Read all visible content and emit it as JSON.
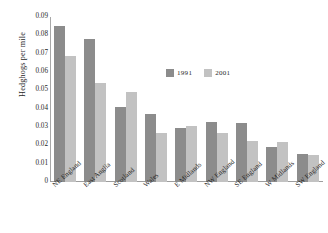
{
  "chart_data": {
    "type": "bar",
    "title": "",
    "xlabel": "",
    "ylabel": "Hedghogs per mile",
    "ylim": [
      0,
      0.09
    ],
    "grid": false,
    "legend_position": "center-right",
    "categories": [
      "NE England",
      "East Anglia",
      "Scotland",
      "Wales",
      "E Midlands",
      "NW England",
      "SE England",
      "W Midlands",
      "SW England"
    ],
    "ytick_labels": [
      "0.09",
      "0.08",
      "0.07",
      "0.06",
      "0.05",
      "0.04",
      "0.03",
      "0.02",
      "0.01",
      "0"
    ],
    "ytick_values": [
      0.09,
      0.08,
      0.07,
      0.06,
      0.05,
      0.04,
      0.03,
      0.02,
      0.01,
      0
    ],
    "series": [
      {
        "name": "1991",
        "color": "#8c8c8c",
        "values": [
          0.085,
          0.078,
          0.041,
          0.037,
          0.0295,
          0.0325,
          0.032,
          0.019,
          0.0155
        ]
      },
      {
        "name": "2001",
        "color": "#c2c2c2",
        "values": [
          0.069,
          0.054,
          0.049,
          0.027,
          0.0305,
          0.027,
          0.0225,
          0.022,
          0.0145
        ]
      }
    ]
  }
}
